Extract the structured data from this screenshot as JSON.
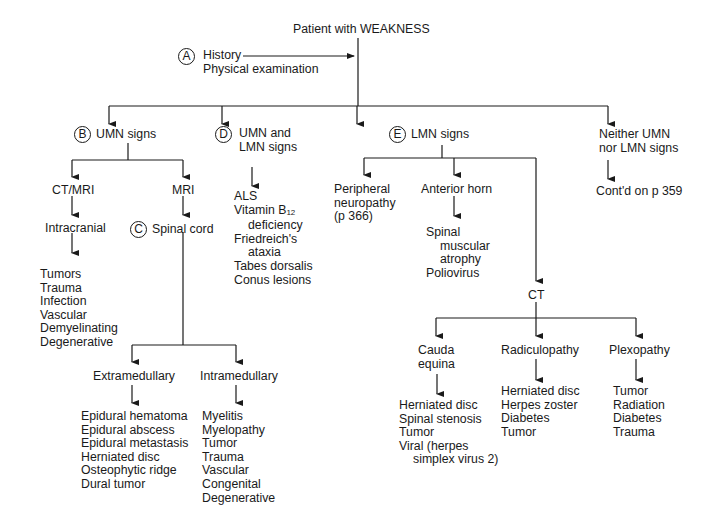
{
  "title": "Patient with WEAKNESS",
  "step_a": {
    "marker": "A",
    "lines": [
      "History",
      "Physical examination"
    ]
  },
  "umn": {
    "marker": "B",
    "label": "UMN signs",
    "ct_mri": "CT/MRI",
    "mri": "MRI",
    "intracranial": "Intracranial",
    "intracranial_causes": [
      "Tumors",
      "Trauma",
      "Infection",
      "Vascular",
      "Demyelinating",
      "Degenerative"
    ],
    "spinal_cord": {
      "marker": "C",
      "label": "Spinal cord"
    },
    "extramedullary": "Extramedullary",
    "extramedullary_causes": [
      "Epidural hematoma",
      "Epidural abscess",
      "Epidural metastasis",
      "Herniated disc",
      "Osteophytic ridge",
      "Dural tumor"
    ],
    "intramedullary": "Intramedullary",
    "intramedullary_causes": [
      "Myelitis",
      "Myelopathy",
      "Tumor",
      "Trauma",
      "Vascular",
      "Congenital",
      "Degenerative"
    ]
  },
  "umn_lmn": {
    "marker": "D",
    "label_lines": [
      "UMN and",
      "LMN signs"
    ],
    "causes": {
      "als": "ALS",
      "b12_a": "Vitamin B",
      "b12_sub": "12",
      "b12_b": "deficiency",
      "fried_a": "Friedreich's",
      "fried_b": "ataxia",
      "tabes": "Tabes dorsalis",
      "conus": "Conus lesions"
    }
  },
  "lmn": {
    "marker": "E",
    "label": "LMN signs",
    "peripheral": [
      "Peripheral",
      "neuropathy",
      "(p 366)"
    ],
    "anterior_horn": "Anterior horn",
    "anterior_horn_causes": {
      "sma_a": "Spinal",
      "sma_b": "muscular",
      "sma_c": "atrophy",
      "polio": "Poliovirus"
    },
    "ct": "CT",
    "cauda": [
      "Cauda",
      "equina"
    ],
    "cauda_causes": {
      "c1": "Herniated disc",
      "c2": "Spinal stenosis",
      "c3": "Tumor",
      "c4": "Viral (herpes",
      "c5": "simplex virus 2)"
    },
    "radiculopathy": "Radiculopathy",
    "radiculopathy_causes": [
      "Herniated disc",
      "Herpes zoster",
      "Diabetes",
      "Tumor"
    ],
    "plexopathy": "Plexopathy",
    "plexopathy_causes": [
      "Tumor",
      "Radiation",
      "Diabetes",
      "Trauma"
    ]
  },
  "neither": {
    "label_lines": [
      "Neither UMN",
      "nor LMN signs"
    ],
    "continued": "Cont'd on p 359"
  }
}
